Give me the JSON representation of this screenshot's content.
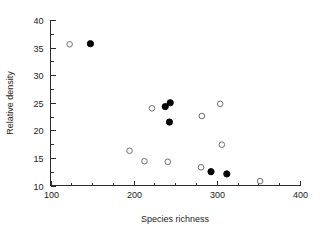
{
  "chart_data": {
    "type": "scatter",
    "title": "",
    "xlabel": "Species richness",
    "ylabel": "Relative density",
    "xlim": [
      100,
      400
    ],
    "ylim": [
      10,
      40
    ],
    "xticks": [
      100,
      200,
      300,
      400
    ],
    "yticks": [
      10,
      15,
      20,
      25,
      30,
      35,
      40
    ],
    "xtick_labels": [
      "100",
      "200",
      "300",
      "400"
    ],
    "ytick_labels": [
      "10",
      "15",
      "20",
      "25",
      "30",
      "35",
      "40"
    ],
    "x_minor_step": 25,
    "y_minor_step": 2.5,
    "grid": false,
    "legend": null,
    "series": [
      {
        "name": "open",
        "marker": "open-circle",
        "color": "#6e6e6e",
        "points": [
          {
            "x": 123,
            "y": 35.6
          },
          {
            "x": 195,
            "y": 16.3
          },
          {
            "x": 213,
            "y": 14.4
          },
          {
            "x": 222,
            "y": 24.0
          },
          {
            "x": 241,
            "y": 14.3
          },
          {
            "x": 281,
            "y": 13.3
          },
          {
            "x": 282,
            "y": 22.6
          },
          {
            "x": 304,
            "y": 24.8
          },
          {
            "x": 306,
            "y": 17.4
          },
          {
            "x": 352,
            "y": 10.8
          }
        ]
      },
      {
        "name": "filled",
        "marker": "filled-circle",
        "color": "#000000",
        "points": [
          {
            "x": 148,
            "y": 35.7
          },
          {
            "x": 238,
            "y": 24.3
          },
          {
            "x": 244,
            "y": 25.0
          },
          {
            "x": 243,
            "y": 21.5
          },
          {
            "x": 293,
            "y": 12.5
          },
          {
            "x": 312,
            "y": 12.1
          }
        ]
      }
    ]
  },
  "axes": {
    "x_title": "Species richness",
    "y_title": "Relative density"
  }
}
